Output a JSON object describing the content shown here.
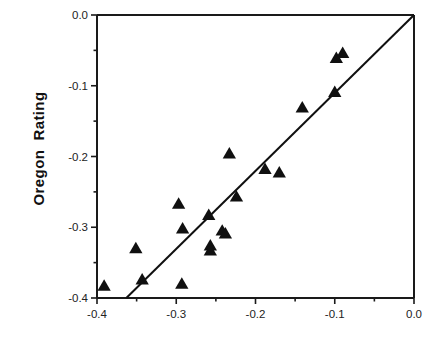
{
  "chart_data": {
    "type": "scatter",
    "title": "",
    "subtitle": "",
    "xlabel": "",
    "ylabel": "Oregon  Rating",
    "xlim": [
      -0.4,
      0.0
    ],
    "ylim": [
      -0.4,
      0.0
    ],
    "xticks": [
      -0.4,
      -0.3,
      -0.2,
      -0.1,
      0.0
    ],
    "xtick_labels": [
      "-0.4",
      "-0.3",
      "-0.2",
      "-0.1",
      "0.0"
    ],
    "yticks": [
      -0.4,
      -0.3,
      -0.2,
      -0.1,
      0.0
    ],
    "ytick_labels": [
      "-0.4",
      "-0.3",
      "-0.2",
      "-0.1",
      "0.0"
    ],
    "x_minor_ticks": [
      -0.35,
      -0.25,
      -0.15,
      -0.05
    ],
    "y_minor_ticks": [
      -0.35,
      -0.25,
      -0.15,
      -0.05
    ],
    "grid": false,
    "legend": null,
    "marker": "triangle-up",
    "marker_color": "#101010",
    "marker_size": 7,
    "axis_color": "#1a1a1a",
    "line_color": "#101010",
    "series": [
      {
        "name": "Observations",
        "marker": "triangle-up",
        "points": [
          {
            "x": -0.391,
            "y": -0.383
          },
          {
            "x": -0.343,
            "y": -0.374
          },
          {
            "x": -0.351,
            "y": -0.33
          },
          {
            "x": -0.293,
            "y": -0.38
          },
          {
            "x": -0.297,
            "y": -0.267
          },
          {
            "x": -0.292,
            "y": -0.302
          },
          {
            "x": -0.259,
            "y": -0.283
          },
          {
            "x": -0.257,
            "y": -0.326
          },
          {
            "x": -0.257,
            "y": -0.333
          },
          {
            "x": -0.242,
            "y": -0.305
          },
          {
            "x": -0.238,
            "y": -0.309
          },
          {
            "x": -0.233,
            "y": -0.196
          },
          {
            "x": -0.224,
            "y": -0.257
          },
          {
            "x": -0.188,
            "y": -0.218
          },
          {
            "x": -0.17,
            "y": -0.223
          },
          {
            "x": -0.141,
            "y": -0.131
          },
          {
            "x": -0.1,
            "y": -0.109
          },
          {
            "x": -0.098,
            "y": -0.061
          },
          {
            "x": -0.09,
            "y": -0.054
          }
        ]
      }
    ],
    "fit_line": {
      "name": "regression-line",
      "x_start": -0.363,
      "y_start": -0.4,
      "x_end": 0.0,
      "y_end": 0.0,
      "slope": 1.102,
      "intercept": 0.0
    }
  }
}
